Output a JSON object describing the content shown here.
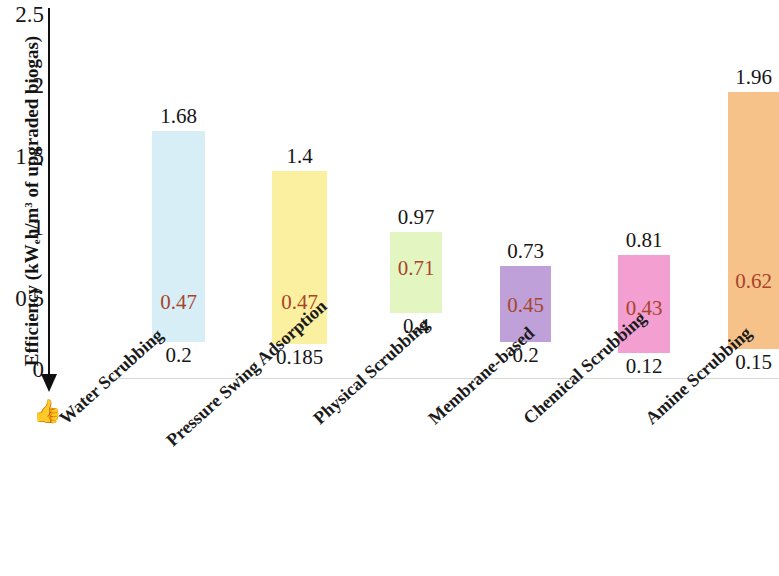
{
  "chart_data": {
    "type": "bar",
    "title": "",
    "subtitle": "",
    "xlabel": "",
    "ylabel": "Efficiency (kWeh/m3 of upgraded biogas)",
    "ylabel_parts": {
      "prefix": "Efficiency (kW",
      "sub": "e",
      "mid": "h/m",
      "sup": "3",
      "suffix": " of upgraded biogas)"
    },
    "ylim": [
      0,
      2.5
    ],
    "yticks": [
      "0",
      "0.5",
      "1",
      "1.5",
      "2",
      "2.5"
    ],
    "ytick_values": [
      0,
      0.5,
      1,
      1.5,
      2,
      2.5
    ],
    "grid": false,
    "legend": "none",
    "axis_direction_note": "downward arrow below axis toward thumbs-up icon",
    "categories": [
      "Water Scrubbing",
      "Pressure Swing Adsorption",
      "Physical Scrubbing",
      "Membrane-based",
      "Chemical Scrubbing",
      "Amine Scrubbing"
    ],
    "series": [
      {
        "name": "Maximum efficiency",
        "values": [
          1.68,
          1.4,
          0.97,
          0.73,
          0.81,
          1.96
        ]
      },
      {
        "name": "Typical efficiency",
        "values": [
          0.47,
          0.47,
          0.71,
          0.45,
          0.43,
          0.62
        ]
      },
      {
        "name": "Minimum efficiency",
        "values": [
          0.2,
          0.185,
          0.4,
          0.2,
          0.12,
          0.15
        ]
      }
    ],
    "bars": [
      {
        "category": "Water Scrubbing",
        "max": 1.68,
        "mid": 0.47,
        "min": 0.2,
        "max_label": "1.68",
        "mid_label": "0.47",
        "min_label": "0.2",
        "color": "#d8eef7"
      },
      {
        "category": "Pressure Swing Adsorption",
        "max": 1.4,
        "mid": 0.47,
        "min": 0.185,
        "max_label": "1.4",
        "mid_label": "0.47",
        "min_label": "0.185",
        "color": "#fbf0a0"
      },
      {
        "category": "Physical Scrubbing",
        "max": 0.97,
        "mid": 0.71,
        "min": 0.4,
        "max_label": "0.97",
        "mid_label": "0.71",
        "min_label": "0.4",
        "color": "#e3f6c2"
      },
      {
        "category": "Membrane-based",
        "max": 0.73,
        "mid": 0.45,
        "min": 0.2,
        "max_label": "0.73",
        "mid_label": "0.45",
        "min_label": "0.2",
        "color": "#bfa0d8"
      },
      {
        "category": "Chemical Scrubbing",
        "max": 0.81,
        "mid": 0.43,
        "min": 0.12,
        "max_label": "0.81",
        "mid_label": "0.43",
        "min_label": "0.12",
        "color": "#f39fd2"
      },
      {
        "category": "Amine Scrubbing",
        "max": 1.96,
        "mid": 0.62,
        "min": 0.15,
        "max_label": "1.96",
        "mid_label": "0.62",
        "min_label": "0.15",
        "color": "#f6c289"
      }
    ],
    "colors": {
      "mid_label_color": "#a8442a",
      "outer_label_color": "#161616",
      "axis_color": "#101010",
      "baseline_color": "#d8d8d8"
    }
  },
  "icons": {
    "thumbs_up": "👍",
    "thumbs_up_name": "thumbs-up-icon"
  }
}
